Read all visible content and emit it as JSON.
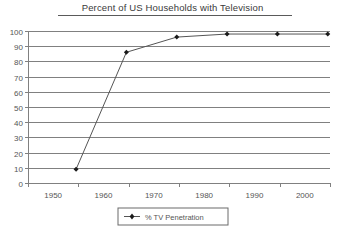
{
  "chart_data": {
    "type": "line",
    "title": "Percent of US Households with Television",
    "xlabel": "",
    "ylabel": "",
    "categories": [
      "1950",
      "1960",
      "1970",
      "1980",
      "1990",
      "2000"
    ],
    "series": [
      {
        "name": "% TV Penetration",
        "values": [
          9,
          86,
          96,
          98,
          98,
          98
        ]
      }
    ],
    "ylim": [
      0,
      100
    ],
    "yticks": [
      0,
      10,
      20,
      30,
      40,
      50,
      60,
      70,
      80,
      90,
      100
    ],
    "ytick_labels": [
      "0",
      "10",
      "20",
      "30",
      "40",
      "50",
      "60",
      "70",
      "80",
      "90",
      "100"
    ],
    "grid": "horizontal",
    "legend_position": "bottom",
    "marker": "diamond",
    "line_color": "#555555",
    "marker_color": "#1a1a1a",
    "grid_color": "#808080",
    "axis_color": "#808080",
    "background": "#ffffff"
  },
  "legend": {
    "entries": [
      {
        "label": "% TV Penetration",
        "symbol": "line-diamond-marker"
      }
    ]
  }
}
